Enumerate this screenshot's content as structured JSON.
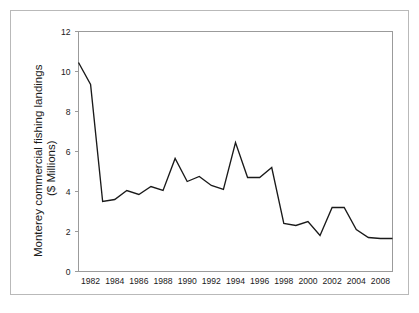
{
  "figure": {
    "border_color": "#b9b9b9",
    "background": "#ffffff"
  },
  "chart_data": {
    "type": "line",
    "title": "",
    "xlabel": "",
    "ylabel": "Monterey commercial fishing landings ($ Millions)",
    "ylabel_line1": "Monterey commercial fishing landings",
    "ylabel_line2": "($ Millions)",
    "ylim": [
      0,
      12
    ],
    "xlim": [
      1981,
      2007
    ],
    "grid": false,
    "legend": false,
    "line_color": "#1a1a1a",
    "y_ticks": [
      0,
      2,
      4,
      6,
      8,
      10,
      12
    ],
    "y_tick_labels": [
      "0",
      "2",
      "4",
      "6",
      "8",
      "10",
      "12"
    ],
    "x_tick_labels": [
      "1982",
      "1984",
      "1986",
      "1988",
      "1990",
      "1992",
      "1994",
      "1996",
      "1998",
      "2000",
      "2002",
      "2004",
      "2008"
    ],
    "x_tick_values": [
      1982,
      1984,
      1986,
      1988,
      1990,
      1992,
      1994,
      1996,
      1998,
      2000,
      2002,
      2004,
      2006
    ],
    "x": [
      1981,
      1982,
      1983,
      1984,
      1985,
      1986,
      1987,
      1988,
      1989,
      1990,
      1991,
      1992,
      1993,
      1994,
      1995,
      1996,
      1997,
      1998,
      1999,
      2000,
      2001,
      2002,
      2003,
      2004,
      2005,
      2006,
      2007
    ],
    "values": [
      10.45,
      9.35,
      3.5,
      3.6,
      4.05,
      3.85,
      4.25,
      4.05,
      5.65,
      4.5,
      4.75,
      4.3,
      4.1,
      6.45,
      4.7,
      4.7,
      5.2,
      2.4,
      2.3,
      2.5,
      1.8,
      3.2,
      3.2,
      2.1,
      1.7,
      1.65,
      1.65
    ],
    "series": [
      {
        "name": "Monterey commercial fishing landings",
        "values": [
          10.45,
          9.35,
          3.5,
          3.6,
          4.05,
          3.85,
          4.25,
          4.05,
          5.65,
          4.5,
          4.75,
          4.3,
          4.1,
          6.45,
          4.7,
          4.7,
          5.2,
          2.4,
          2.3,
          2.5,
          1.8,
          3.2,
          3.2,
          2.1,
          1.7,
          1.65,
          1.65
        ]
      }
    ]
  }
}
